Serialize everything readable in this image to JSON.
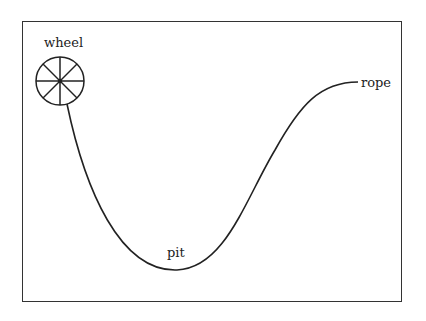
{
  "diagram": {
    "labels": {
      "wheel": "wheel",
      "rope": "rope",
      "pit": "pit"
    },
    "colors": {
      "stroke": "#222222",
      "border": "#333333",
      "background": "#ffffff"
    }
  }
}
